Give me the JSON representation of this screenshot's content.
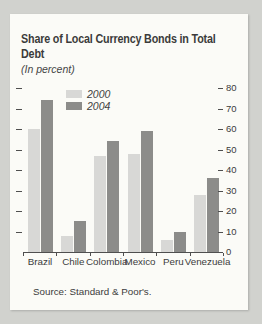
{
  "page": {
    "background_color": "#d1d2ce",
    "card_color": "#fbfbf7"
  },
  "card": {
    "title_lines": [
      "Share of Local Currency Bonds in Total",
      "Debt"
    ],
    "subtitle": "(In percent)",
    "source": "Source: Standard & Poor's."
  },
  "chart_data": {
    "type": "bar",
    "title": "Share of Local Currency Bonds in Total Debt",
    "subtitle": "(In percent)",
    "categories": [
      "Brazil",
      "Chile",
      "Colombia",
      "Mexico",
      "Peru",
      "Venezuela"
    ],
    "series": [
      {
        "name": "2000",
        "color": "#d8d8d6",
        "values": [
          60,
          8,
          47,
          48,
          6,
          28
        ]
      },
      {
        "name": "2004",
        "color": "#8c8c8a",
        "values": [
          74,
          15,
          54,
          59,
          10,
          36
        ]
      }
    ],
    "ylim": [
      0,
      80
    ],
    "yticks_right": [
      0,
      10,
      20,
      30,
      40,
      50,
      60,
      70,
      80
    ],
    "yticks_left_dashes": [
      10,
      20,
      30,
      40,
      50,
      60,
      70,
      80
    ],
    "xlabel": "",
    "ylabel": "",
    "grid": false,
    "legend_position": "top-center-inside",
    "source": "Source: Standard & Poor's."
  }
}
